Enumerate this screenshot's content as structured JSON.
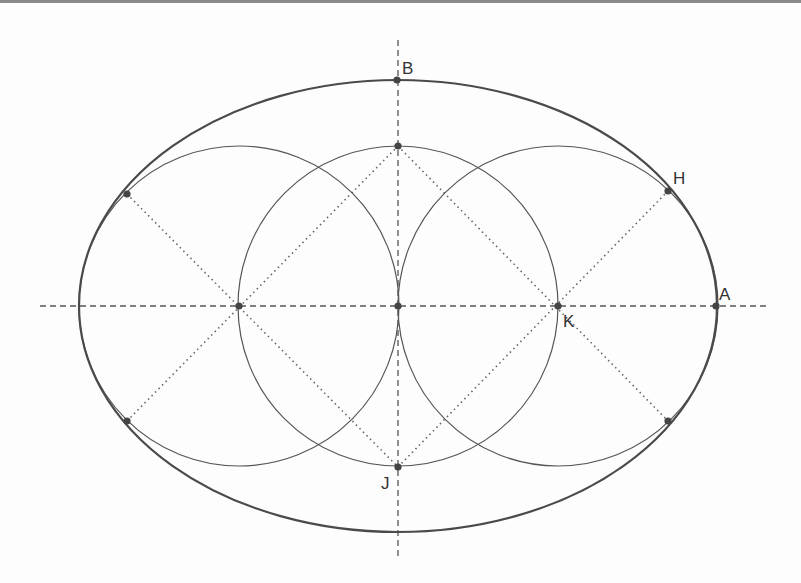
{
  "diagram": {
    "colors": {
      "background": "#fdfdfd",
      "stroke": "#555555",
      "point": "#444444",
      "border": "#8a8a8a"
    },
    "labels": {
      "A": "A",
      "B": "B",
      "H": "H",
      "K": "K",
      "J": "J"
    },
    "ellipse": {
      "cx": 398,
      "cy": 306,
      "rx": 319,
      "ry": 226
    },
    "circles": [
      {
        "name": "left-circle",
        "cx": 239,
        "cy": 306,
        "r": 160
      },
      {
        "name": "center-circle",
        "cx": 398,
        "cy": 306,
        "r": 160
      },
      {
        "name": "right-circle",
        "cx": 558,
        "cy": 306,
        "r": 160
      }
    ],
    "axes": {
      "horizontal": {
        "x1": 40,
        "y": 306,
        "x2": 766
      },
      "vertical": {
        "x": 398,
        "y1": 40,
        "y2": 558
      }
    },
    "points": [
      {
        "label": "A",
        "x": 716,
        "y": 306
      },
      {
        "label": "B",
        "x": 397,
        "y": 80
      },
      {
        "label": "H",
        "x": 668,
        "y": 191
      },
      {
        "label": "K",
        "x": 558,
        "y": 306
      },
      {
        "label": "J",
        "x": 398,
        "y": 467
      }
    ]
  }
}
